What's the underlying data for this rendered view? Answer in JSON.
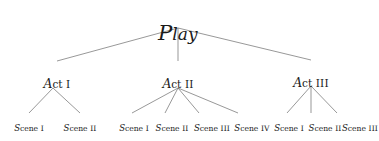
{
  "diagram": {
    "title": "Play",
    "type": "tree",
    "background_color": "#ffffff",
    "line_color": "#6b6b6b",
    "text_color": "#1a1a1a"
  },
  "root": {
    "label": "Play",
    "lead": "P",
    "rest": "lay",
    "x": 178,
    "y": 20
  },
  "acts": [
    {
      "label": "Act I",
      "lead": "A",
      "rest": "ct",
      "numeral": "I",
      "x": 57,
      "y": 76
    },
    {
      "label": "Act II",
      "lead": "A",
      "rest": "ct",
      "numeral": "II",
      "x": 178,
      "y": 76
    },
    {
      "label": "Act III",
      "lead": "A",
      "rest": "ct",
      "numeral": "III",
      "x": 311,
      "y": 75
    }
  ],
  "scenes": [
    {
      "label": "Scene I",
      "lead": "S",
      "rest": "cene",
      "numeral": "I",
      "act": "Act I",
      "x": 29,
      "y": 123
    },
    {
      "label": "Scene II",
      "lead": "S",
      "rest": "cene",
      "numeral": "II",
      "act": "Act I",
      "x": 80,
      "y": 123
    },
    {
      "label": "Scene I",
      "lead": "S",
      "rest": "cene",
      "numeral": "I",
      "act": "Act II",
      "x": 134,
      "y": 123
    },
    {
      "label": "Scene II",
      "lead": "S",
      "rest": "cene",
      "numeral": "II",
      "act": "Act II",
      "x": 172,
      "y": 123
    },
    {
      "label": "Scene III",
      "lead": "S",
      "rest": "cene",
      "numeral": "III",
      "act": "Act II",
      "x": 212,
      "y": 123
    },
    {
      "label": "Scene IV",
      "lead": "S",
      "rest": "cene",
      "numeral": "IV",
      "act": "Act II",
      "x": 252,
      "y": 123
    },
    {
      "label": "Scene I",
      "lead": "S",
      "rest": "cene",
      "numeral": "I",
      "act": "Act III",
      "x": 289,
      "y": 123
    },
    {
      "label": "Scene II",
      "lead": "S",
      "rest": "cene",
      "numeral": "II",
      "act": "Act III",
      "x": 325,
      "y": 123
    },
    {
      "label": "Scene III",
      "lead": "S",
      "rest": "cene",
      "numeral": "III",
      "act": "Act III",
      "x": 360,
      "y": 123
    }
  ],
  "edges": [
    {
      "name": "edge-play-act-1",
      "x1": 178,
      "y1": 28,
      "x2": 57,
      "y2": 61
    },
    {
      "name": "edge-play-act-2",
      "x1": 178,
      "y1": 28,
      "x2": 178,
      "y2": 61
    },
    {
      "name": "edge-play-act-3",
      "x1": 178,
      "y1": 28,
      "x2": 311,
      "y2": 60
    },
    {
      "name": "edge-act1-scene-1",
      "x1": 53,
      "y1": 88,
      "x2": 29,
      "y2": 113
    },
    {
      "name": "edge-act1-scene-2",
      "x1": 53,
      "y1": 88,
      "x2": 80,
      "y2": 113
    },
    {
      "name": "edge-act2-scene-1",
      "x1": 178,
      "y1": 88,
      "x2": 132,
      "y2": 113
    },
    {
      "name": "edge-act2-scene-2",
      "x1": 178,
      "y1": 88,
      "x2": 165,
      "y2": 113
    },
    {
      "name": "edge-act2-scene-3",
      "x1": 178,
      "y1": 88,
      "x2": 199,
      "y2": 113
    },
    {
      "name": "edge-act2-scene-4",
      "x1": 178,
      "y1": 88,
      "x2": 238,
      "y2": 113
    },
    {
      "name": "edge-act3-scene-1",
      "x1": 311,
      "y1": 86,
      "x2": 287,
      "y2": 113
    },
    {
      "name": "edge-act3-scene-2",
      "x1": 311,
      "y1": 86,
      "x2": 311,
      "y2": 113
    },
    {
      "name": "edge-act3-scene-3",
      "x1": 311,
      "y1": 86,
      "x2": 337,
      "y2": 113
    }
  ]
}
